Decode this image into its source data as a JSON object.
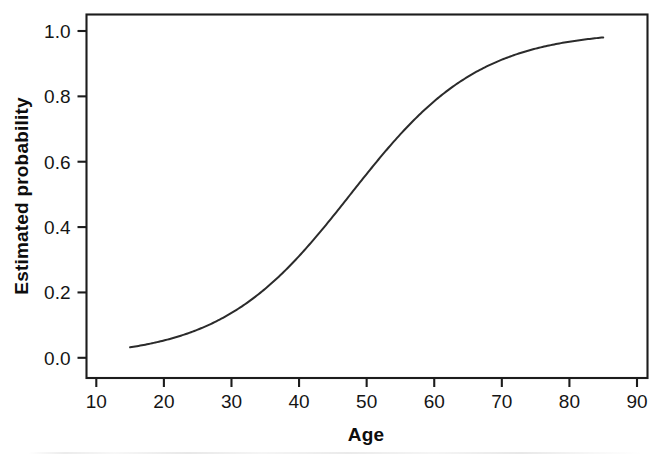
{
  "figure": {
    "background_color": "#ffffff",
    "ink_color": "#1c1c1c"
  },
  "chart_data": {
    "type": "line",
    "title": "",
    "subtitle": "",
    "xlabel": "Age",
    "ylabel": "Estimated probability",
    "xlim": [
      10,
      90
    ],
    "ylim": [
      0.0,
      1.0
    ],
    "xticks": [
      10,
      20,
      30,
      40,
      50,
      60,
      70,
      80,
      90
    ],
    "xtick_labels": [
      "10",
      "20",
      "30",
      "40",
      "50",
      "60",
      "70",
      "80",
      "90"
    ],
    "yticks": [
      0.0,
      0.2,
      0.4,
      0.6,
      0.8,
      1.0
    ],
    "ytick_labels": [
      "0.0",
      "0.2",
      "0.4",
      "0.6",
      "0.8",
      "1.0"
    ],
    "grid": false,
    "legend": false,
    "legend_position": "none",
    "line_color": "#2b2b2b",
    "line_width": 2.0,
    "annotations": [],
    "series": [
      {
        "name": "Estimated probability",
        "x": [
          15,
          17,
          19,
          21,
          23,
          25,
          27,
          29,
          31,
          33,
          35,
          37,
          39,
          41,
          43,
          45,
          47,
          49,
          51,
          53,
          55,
          57,
          59,
          61,
          63,
          65,
          67,
          69,
          71,
          73,
          75,
          77,
          79,
          81,
          83,
          85
        ],
        "values": [
          0.025,
          0.031,
          0.038,
          0.047,
          0.058,
          0.071,
          0.087,
          0.106,
          0.129,
          0.156,
          0.188,
          0.225,
          0.267,
          0.314,
          0.366,
          0.421,
          0.478,
          0.536,
          0.593,
          0.647,
          0.698,
          0.744,
          0.786,
          0.822,
          0.853,
          0.88,
          0.902,
          0.92,
          0.935,
          0.947,
          0.957,
          0.964,
          0.97,
          0.975,
          0.978,
          0.977
        ]
      }
    ],
    "model": {
      "form": "logistic",
      "midpoint_age": 47.6,
      "slope_k": 0.1045
    }
  }
}
